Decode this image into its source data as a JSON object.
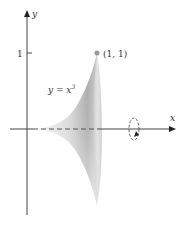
{
  "figure": {
    "type": "solid-of-revolution",
    "axes": {
      "x_label": "x",
      "y_label": "y",
      "y_tick_label": "1"
    },
    "curve": {
      "equation_lhs": "y = x",
      "equation_exponent": "3"
    },
    "point": {
      "label": "(1, 1)"
    },
    "rotation_axis": "x",
    "colors": {
      "axis": "#444444",
      "point": "#999999",
      "solid_dark": "#9a9a9a",
      "solid_light": "#f2f2f2"
    }
  }
}
